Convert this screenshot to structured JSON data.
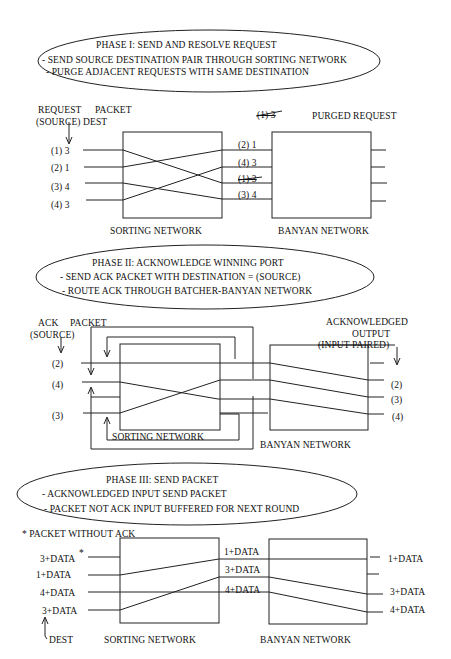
{
  "phase1": {
    "title": "PHASE I: SEND AND RESOLVE REQUEST",
    "bullets": [
      "- SEND SOURCE DESTINATION PAIR THROUGH SORTING NETWORK",
      "- PURGE ADJACENT REQUESTS WITH SAME DESTINATION"
    ],
    "header_request": "REQUEST",
    "header_packet": "PACKET",
    "header_source_dest": "(SOURCE) DEST",
    "purged_label": "PURGED REQUEST",
    "purged_example": "(1) 3",
    "inputs": [
      "(1) 3",
      "(2) 1",
      "(3) 4",
      "(4) 3"
    ],
    "sorted_outputs": [
      "(2) 1",
      "(4) 3",
      "(1) 3",
      "(3) 4"
    ],
    "sorting_label": "SORTING NETWORK",
    "banyan_label": "BANYAN NETWORK"
  },
  "phase2": {
    "title": "PHASE II: ACKNOWLEDGE WINNING PORT",
    "bullets": [
      "- SEND ACK PACKET WITH DESTINATION = (SOURCE)",
      "- ROUTE ACK THROUGH BATCHER-BANYAN NETWORK"
    ],
    "header_ack": "ACK",
    "header_packet": "PACKET",
    "header_source": "(SOURCE)",
    "ack_output_label": [
      "ACKNOWLEDGED",
      "OUTPUT",
      "(INPUT PAIRED)"
    ],
    "inputs": [
      "(2)",
      "(4)",
      "(3)"
    ],
    "outputs": [
      "(2)",
      "(3)",
      "(4)"
    ],
    "sorting_label": "SORTING NETWORK",
    "banyan_label": "BANYAN NETWORK"
  },
  "phase3": {
    "title": "PHASE III: SEND PACKET",
    "bullets": [
      "- ACKNOWLEDGED INPUT SEND PACKET",
      "- PACKET NOT ACK INPUT BUFFERED FOR NEXT ROUND"
    ],
    "footnote": "* PACKET WITHOUT ACK",
    "inputs": [
      "3+DATA",
      "1+DATA",
      "4+DATA",
      "3+DATA"
    ],
    "input_star": "*",
    "sorted_outputs": [
      "1+DATA",
      "3+DATA",
      "4+DATA"
    ],
    "outputs": [
      "1+DATA",
      "3+DATA",
      "4+DATA"
    ],
    "dest_label": "DEST",
    "sorting_label": "SORTING NETWORK",
    "banyan_label": "BANYAN NETWORK"
  }
}
